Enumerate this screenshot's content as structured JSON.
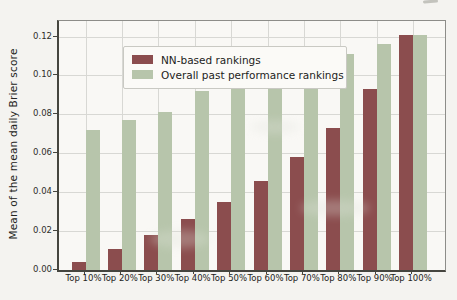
{
  "chart_data": {
    "type": "bar",
    "title": "",
    "categories": [
      "Top 10%",
      "Top 20%",
      "Top 30%",
      "Top 40%",
      "Top 50%",
      "Top 60%",
      "Top 70%",
      "Top 80%",
      "Top 90%",
      "Top 100%"
    ],
    "series": [
      {
        "name": "NN-based rankings",
        "color": "#8b4d4e",
        "values": [
          0.004,
          0.011,
          0.018,
          0.026,
          0.035,
          0.046,
          0.058,
          0.073,
          0.093,
          0.121
        ]
      },
      {
        "name": "Overall past performance rankings",
        "color": "#b7c5ab",
        "values": [
          0.072,
          0.077,
          0.081,
          0.092,
          0.097,
          0.102,
          0.107,
          0.111,
          0.116,
          0.121
        ]
      }
    ],
    "xlabel": "",
    "ylabel": "Mean of the mean daily Brier score",
    "ytick_values": [
      0,
      0.02,
      0.04,
      0.06,
      0.08,
      0.1,
      0.12
    ],
    "ylim": [
      0,
      0.128
    ],
    "grid": true,
    "legend_position": "upper left"
  },
  "colors": {
    "paper": "#f4f3f0",
    "plot_bg": "#f9f8f5",
    "grid": "#d8d8d4",
    "spine_dark": "#45453f",
    "spine_light": "#8d8d89",
    "legend_bg": "#fbfaf7",
    "legend_border": "#c9c9c3"
  }
}
